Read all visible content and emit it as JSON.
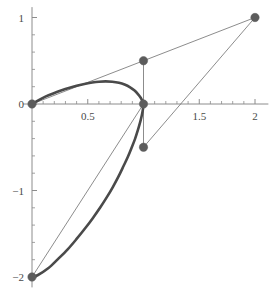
{
  "chart_data": {
    "type": "line",
    "title": "",
    "xlabel": "",
    "ylabel": "",
    "xlim": [
      -0.08,
      2.12
    ],
    "ylim": [
      -2.12,
      1.12
    ],
    "grid": false,
    "legend": null,
    "x_ticks_labeled": [
      {
        "value": 0.5,
        "label": "0.5"
      },
      {
        "value": 1.5,
        "label": "1.5"
      },
      {
        "value": 2,
        "label": "2"
      }
    ],
    "x_ticks_minor": [
      0.1,
      0.2,
      0.3,
      0.4,
      0.6,
      0.7,
      0.8,
      0.9,
      1.1,
      1.2,
      1.3,
      1.4,
      1.6,
      1.7,
      1.8,
      1.9
    ],
    "x_ticks_major": [
      0.5,
      1.0,
      1.5,
      2.0
    ],
    "y_ticks_labeled": [
      {
        "value": 1,
        "label": "1"
      },
      {
        "value": 0,
        "label": "0"
      },
      {
        "value": -1,
        "label": "-1"
      },
      {
        "value": -2,
        "label": "-2"
      }
    ],
    "y_ticks_minor": [
      0.8,
      0.6,
      0.4,
      0.2,
      -0.2,
      -0.4,
      -0.6,
      -0.8,
      -1.2,
      -1.4,
      -1.6,
      -1.8
    ],
    "y_ticks_major": [
      1,
      0,
      -1,
      -2
    ],
    "series": [
      {
        "name": "upper-loop-curve",
        "type": "thick-curve",
        "color": "#4a4a4a",
        "width": 2.6,
        "points": [
          [
            0.0,
            0.0
          ],
          [
            0.06,
            0.045
          ],
          [
            0.12,
            0.085
          ],
          [
            0.19,
            0.122
          ],
          [
            0.26,
            0.155
          ],
          [
            0.33,
            0.185
          ],
          [
            0.4,
            0.21
          ],
          [
            0.47,
            0.232
          ],
          [
            0.54,
            0.248
          ],
          [
            0.6,
            0.258
          ],
          [
            0.66,
            0.262
          ],
          [
            0.72,
            0.258
          ],
          [
            0.78,
            0.245
          ],
          [
            0.83,
            0.225
          ],
          [
            0.88,
            0.193
          ],
          [
            0.92,
            0.155
          ],
          [
            0.95,
            0.115
          ],
          [
            0.975,
            0.072
          ],
          [
            0.99,
            0.032
          ],
          [
            1.0,
            0.0
          ]
        ]
      },
      {
        "name": "lower-descending-curve",
        "type": "thick-curve",
        "color": "#4a4a4a",
        "width": 2.6,
        "points": [
          [
            1.0,
            0.0
          ],
          [
            0.995,
            -0.06
          ],
          [
            0.985,
            -0.13
          ],
          [
            0.97,
            -0.21
          ],
          [
            0.95,
            -0.3
          ],
          [
            0.925,
            -0.4
          ],
          [
            0.895,
            -0.5
          ],
          [
            0.86,
            -0.61
          ],
          [
            0.82,
            -0.72
          ],
          [
            0.775,
            -0.84
          ],
          [
            0.725,
            -0.96
          ],
          [
            0.67,
            -1.08
          ],
          [
            0.61,
            -1.2
          ],
          [
            0.545,
            -1.32
          ],
          [
            0.475,
            -1.44
          ],
          [
            0.4,
            -1.56
          ],
          [
            0.32,
            -1.68
          ],
          [
            0.235,
            -1.79
          ],
          [
            0.145,
            -1.9
          ],
          [
            0.05,
            -1.98
          ],
          [
            0.0,
            -2.0
          ]
        ]
      },
      {
        "name": "control-polygon",
        "type": "thin-lines",
        "color": "#6e6e6e",
        "width": 0.8,
        "segments": [
          {
            "name": "origin-to-upper-control",
            "from": [
              0.0,
              0.0
            ],
            "to": [
              1.0,
              0.5
            ]
          },
          {
            "name": "upper-control-to-endpoint",
            "from": [
              1.0,
              0.5
            ],
            "to": [
              2.0,
              1.0
            ]
          },
          {
            "name": "upper-control-vertical",
            "from": [
              1.0,
              0.5
            ],
            "to": [
              1.0,
              0.0
            ]
          },
          {
            "name": "lower-control-vertical",
            "from": [
              1.0,
              0.0
            ],
            "to": [
              1.0,
              -0.5
            ]
          },
          {
            "name": "lower-control-to-endpoint",
            "from": [
              1.0,
              -0.5
            ],
            "to": [
              2.0,
              1.0
            ]
          },
          {
            "name": "bottom-to-knot",
            "from": [
              0.0,
              -2.0
            ],
            "to": [
              1.0,
              0.0
            ]
          }
        ]
      }
    ],
    "markers": [
      {
        "name": "marker-origin",
        "x": 0.0,
        "y": 0.0,
        "label": "(0, 0)"
      },
      {
        "name": "marker-upper-control",
        "x": 1.0,
        "y": 0.5,
        "label": "(1, 0.5)"
      },
      {
        "name": "marker-knot",
        "x": 1.0,
        "y": 0.0,
        "label": "(1, 0)"
      },
      {
        "name": "marker-lower-control",
        "x": 1.0,
        "y": -0.5,
        "label": "(1, -0.5)"
      },
      {
        "name": "marker-right-endpoint",
        "x": 2.0,
        "y": 1.0,
        "label": "(2, 1)"
      },
      {
        "name": "marker-bottom-endpoint",
        "x": 0.0,
        "y": -2.0,
        "label": "(0, -2)"
      }
    ],
    "colors": {
      "background": "#ffffff",
      "axis": "#8c8c8c",
      "curve": "#4a4a4a",
      "thin_line": "#6e6e6e",
      "marker": "#5c5c5c",
      "tick_label": "#4a4a4a"
    },
    "marker_radius": 4.2
  }
}
